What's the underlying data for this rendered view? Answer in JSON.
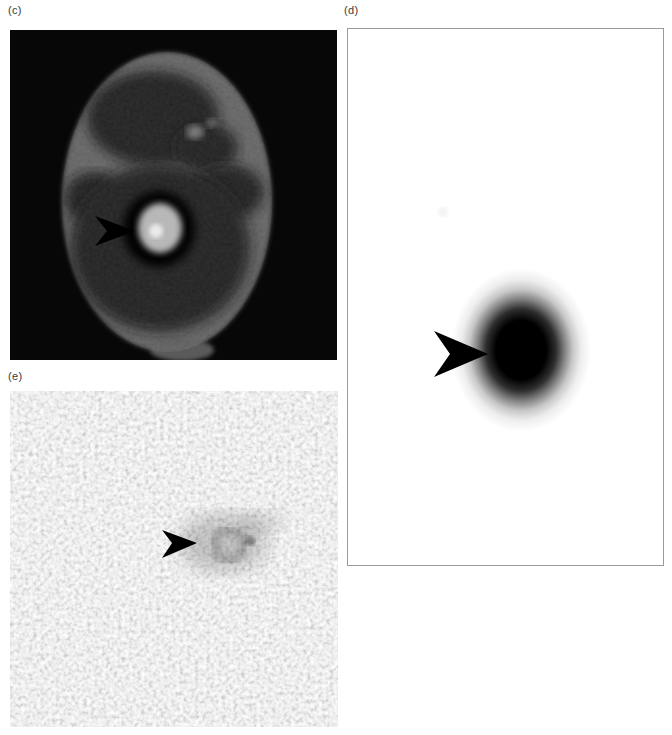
{
  "figure": {
    "panels": {
      "c": {
        "label": "(c)",
        "alt": "Axial CT brain slice: bright round hyperdense lesion with dark surrounding ring, marked by a black arrowhead"
      },
      "d": {
        "label": "(d)",
        "alt": "Scintigraphic image: single focal dark uptake spot on white background, marked by a black arrowhead"
      },
      "e": {
        "label": "(e)",
        "alt": "Grainy gradient-echo MR image: faint dark rounded lesion in noise, marked by a black arrowhead"
      }
    },
    "colors": {
      "page_background": "#ffffff",
      "ct_background": "#070707",
      "head_gray": "#5f5f5f",
      "brain_dark": "#161616",
      "lesion_ring": "#000000",
      "lesion_bright": "#b8b8b8",
      "lesion_core": "#eaeaea",
      "hotspot": "#000000",
      "arrowhead": "#000000",
      "panel_d_border": "#9a9a9a",
      "label_text": "#3a3a3a"
    },
    "icons": {
      "arrowhead": "arrowhead-right-icon"
    }
  }
}
